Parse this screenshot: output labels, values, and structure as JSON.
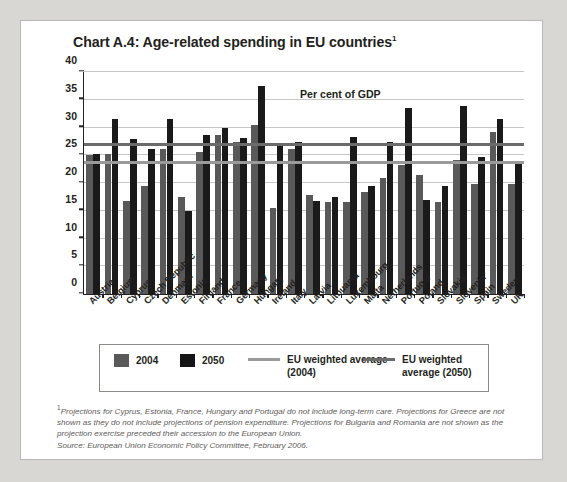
{
  "title": "Chart A.4: Age-related spending in EU countries",
  "title_footnote_marker": "1",
  "chart_data": {
    "type": "bar",
    "title": "Chart A.4: Age-related spending in EU countries",
    "annotation": "Per cent of GDP",
    "xlabel": "",
    "ylabel": "",
    "ylim": [
      0,
      40
    ],
    "yticks": [
      0,
      5,
      10,
      15,
      20,
      25,
      30,
      35,
      40
    ],
    "ytick_labels": [
      "0",
      "5",
      "10",
      "15",
      "20",
      "25",
      "30",
      "35",
      "40"
    ],
    "grid": true,
    "legend_position": "below",
    "categories": [
      "Austria",
      "Belgium",
      "Cyprus",
      "Czech Republic",
      "Denmark",
      "Estonia",
      "Finland",
      "France",
      "Germany",
      "Hungary",
      "Ireland",
      "Italy",
      "Latvia",
      "Lithuania",
      "Luxembourg",
      "Malta",
      "Netherlands",
      "Portugal",
      "Poland",
      "Slovakia",
      "Slovenia",
      "Spain",
      "Sweden",
      "UK"
    ],
    "series": [
      {
        "name": "2004",
        "color": "#595959",
        "values": [
          25.0,
          25.2,
          16.8,
          19.5,
          26.2,
          17.5,
          25.5,
          28.6,
          27.4,
          30.5,
          15.5,
          26.2,
          17.8,
          16.6,
          16.6,
          18.4,
          20.9,
          23.2,
          21.5,
          16.5,
          24.1,
          19.8,
          29.2,
          19.8
        ]
      },
      {
        "name": "2050",
        "color": "#1a1a1a",
        "values": [
          25.3,
          31.6,
          28.0,
          26.2,
          31.6,
          14.9,
          28.6,
          30.0,
          28.1,
          37.4,
          26.6,
          27.4,
          16.7,
          17.4,
          28.3,
          19.5,
          27.4,
          33.5,
          17.0,
          19.5,
          33.8,
          24.6,
          31.5,
          23.5
        ]
      }
    ],
    "reference_lines": [
      {
        "name": "EU weighted average (2004)",
        "value": 23.4,
        "color": "#9a9a9a"
      },
      {
        "name": "EU weighted average (2050)",
        "value": 26.7,
        "color": "#6b6b6b"
      }
    ]
  },
  "legend": {
    "items": [
      {
        "label": "2004",
        "kind": "swatch",
        "color": "#595959"
      },
      {
        "label": "2050",
        "kind": "swatch",
        "color": "#151515"
      },
      {
        "label": "EU weighted average  (2004)",
        "kind": "line",
        "color": "#9a9a9a"
      },
      {
        "label": "EU weighted average (2050)",
        "kind": "line",
        "color": "#6b6b6b"
      }
    ]
  },
  "footnote": {
    "marker": "1",
    "text": "Projections for Cyprus, Estonia, France, Hungary and Portugal do not include long-term care. Projections for Greece are not shown as they do not include projections of pension expenditure. Projections for Bulgaria and Romania are not shown as the projection exercise preceded their accession to the European Union.",
    "source": "Source: European Union Economic Policy Committee, February 2006."
  }
}
